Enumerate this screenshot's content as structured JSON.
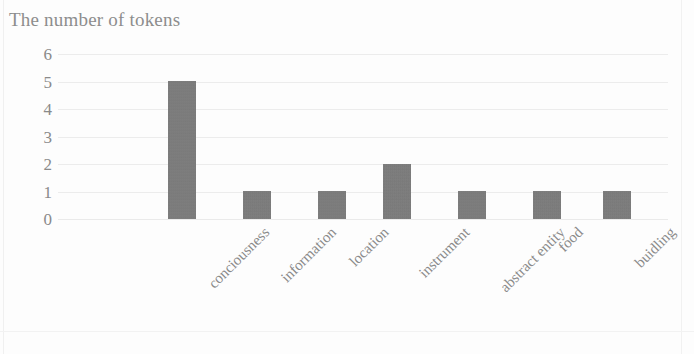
{
  "chart_data": {
    "type": "bar",
    "title": "The number of tokens",
    "xlabel": "",
    "ylabel": "",
    "categories": [
      "conciousness",
      "information",
      "location",
      "instrument",
      "abstract entity",
      "food",
      "buidling"
    ],
    "values": [
      5,
      1,
      1,
      2,
      1,
      1,
      1
    ],
    "ylim": [
      0,
      6
    ],
    "yticks": [
      "0",
      "1",
      "2",
      "3",
      "4",
      "5",
      "6"
    ],
    "grid": true,
    "legend": false,
    "legend_position": "none",
    "bar_color": "#787878",
    "grid_color": "#ececec",
    "text_color": "#8a8a8a",
    "background": "#fdfdfd",
    "xtick_rotation": -45
  }
}
